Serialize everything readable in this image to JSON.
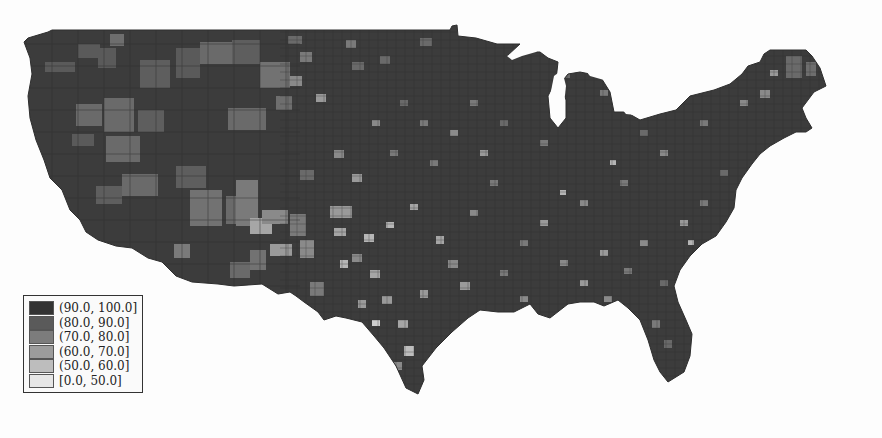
{
  "map": {
    "subject": "Contiguous United States, county-level choropleth",
    "style": "grayscale",
    "has_title": false,
    "background_color": "#fdfdfd",
    "land_default_color": "#3a3a3a"
  },
  "legend": {
    "position": "bottom-left",
    "items": [
      {
        "label": "(90.0, 100.0]",
        "color": "#333333"
      },
      {
        "label": "(80.0, 90.0]",
        "color": "#5a5a5a"
      },
      {
        "label": "(70.0, 80.0]",
        "color": "#7c7c7c"
      },
      {
        "label": "(60.0, 70.0]",
        "color": "#9c9c9c"
      },
      {
        "label": "(50.0, 60.0]",
        "color": "#bdbdbd"
      },
      {
        "label": "[0.0, 50.0]",
        "color": "#e6e6e6"
      }
    ]
  }
}
